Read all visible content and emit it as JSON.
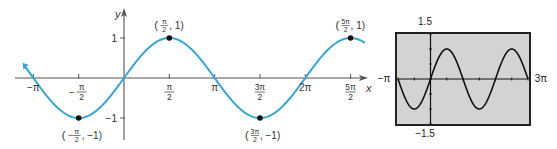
{
  "chart_data": [
    {
      "type": "line",
      "title": "",
      "function": "y = sin x",
      "xlabel": "x",
      "ylabel": "y",
      "xlim": [
        -3.4,
        8.4
      ],
      "ylim": [
        -1.2,
        1.2
      ],
      "grid": false,
      "line_color": "#3aa5cf",
      "x_ticks": [
        {
          "value": -3.14159,
          "label": "−π"
        },
        {
          "value": -1.5708,
          "label_num": "π",
          "label_den": "2",
          "sign": "−"
        },
        {
          "value": 1.5708,
          "label_num": "π",
          "label_den": "2",
          "sign": ""
        },
        {
          "value": 3.14159,
          "label": "π"
        },
        {
          "value": 4.71239,
          "label_num": "3π",
          "label_den": "2",
          "sign": ""
        },
        {
          "value": 6.28319,
          "label": "2π"
        },
        {
          "value": 7.85398,
          "label_num": "5π",
          "label_den": "2",
          "sign": ""
        }
      ],
      "y_ticks": [
        {
          "value": 1,
          "label": "1"
        },
        {
          "value": -1,
          "label": "−1"
        }
      ],
      "points": [
        {
          "x": -1.5708,
          "y": -1,
          "label_num": "π",
          "label_den": "2",
          "sign": "−",
          "yval": "−1"
        },
        {
          "x": 1.5708,
          "y": 1,
          "label_num": "π",
          "label_den": "2",
          "sign": "",
          "yval": "1"
        },
        {
          "x": 4.71239,
          "y": -1,
          "label_num": "3π",
          "label_den": "2",
          "sign": "",
          "yval": "−1"
        },
        {
          "x": 7.85398,
          "y": 1,
          "label_num": "5π",
          "label_den": "2",
          "sign": "",
          "yval": "1"
        }
      ]
    },
    {
      "type": "line",
      "title": "Graphing calculator window",
      "function": "y = sin x",
      "xlim": [
        -3.14159,
        9.42478
      ],
      "ylim": [
        -1.5,
        1.5
      ],
      "x_min_label": "−π",
      "x_max_label": "3π",
      "y_max_label": "1.5",
      "y_min_label": "−1.5",
      "x_scale": 1.5708,
      "y_scale": 0.5,
      "background": "#d2d3d2",
      "line_color": "#111111"
    }
  ]
}
